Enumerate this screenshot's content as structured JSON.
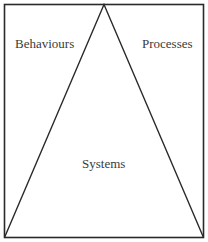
{
  "diagram": {
    "type": "triangle-in-box",
    "colors": {
      "stroke": "#2a2a2a",
      "text": "#3a3a3a",
      "background": "#ffffff"
    },
    "labels": {
      "left_region": "Behaviours",
      "right_region": "Processes",
      "center_region": "Systems"
    }
  }
}
